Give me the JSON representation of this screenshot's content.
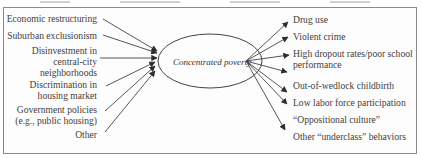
{
  "diagram": {
    "center_node": {
      "label": "Concentrated poverty",
      "shape": "ellipse"
    },
    "causes": [
      {
        "label": "Economic restructuring"
      },
      {
        "label": "Suburban exclusionism"
      },
      {
        "label": "Disinvestment in\ncentral-city\nneighborhoods"
      },
      {
        "label": "Discrimination in\nhousing market"
      },
      {
        "label": "Government policies\n(e.g., public housing)"
      },
      {
        "label": "Other"
      }
    ],
    "effects": [
      {
        "label": "Drug use"
      },
      {
        "label": "Violent crime"
      },
      {
        "label": "High dropout rates/poor school\nperformance"
      },
      {
        "label": "Out-of-wedlock childbirth"
      },
      {
        "label": "Low labor force participation"
      },
      {
        "label": "“Oppositional culture”"
      },
      {
        "label": "Other “underclass” behaviors"
      }
    ],
    "colors": {
      "border": "#8a8a8a",
      "arrow": "#3a3a3a",
      "text": "#3d3d3d"
    }
  }
}
